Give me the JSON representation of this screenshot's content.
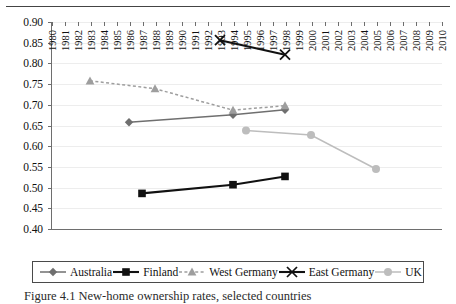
{
  "figure": {
    "caption": "Figure 4.1  New-home ownership rates, selected countries",
    "background": "#ffffff"
  },
  "chart_data": {
    "type": "line",
    "title": "",
    "xlabel": "",
    "ylabel": "",
    "xlim": [
      1980,
      2010
    ],
    "ylim": [
      0.4,
      0.9
    ],
    "grid": true,
    "legend_position": "bottom",
    "x_tick_labels": [
      "1980",
      "1981",
      "1982",
      "1983",
      "1984",
      "1985",
      "1986",
      "1987",
      "1988",
      "1989",
      "1990",
      "1991",
      "1992",
      "1993",
      "1994",
      "1995",
      "1996",
      "1997",
      "1998",
      "1999",
      "2000",
      "2001",
      "2002",
      "2003",
      "2004",
      "2005",
      "2006",
      "2007",
      "2008",
      "2009",
      "2010"
    ],
    "y_tick_labels": [
      "0.40",
      "0.45",
      "0.50",
      "0.55",
      "0.60",
      "0.65",
      "0.70",
      "0.75",
      "0.80",
      "0.85",
      "0.90"
    ],
    "y_tick_values": [
      0.4,
      0.45,
      0.5,
      0.55,
      0.6,
      0.65,
      0.7,
      0.75,
      0.8,
      0.85,
      0.9
    ],
    "series": [
      {
        "name": "Australia",
        "marker": "diamond",
        "line_style": "solid",
        "color": "#6f6f6f",
        "points": [
          {
            "x": 1986,
            "y": 0.658
          },
          {
            "x": 1994,
            "y": 0.676
          },
          {
            "x": 1998,
            "y": 0.688
          }
        ]
      },
      {
        "name": "Finland",
        "marker": "square",
        "line_style": "solid",
        "color": "#111111",
        "points": [
          {
            "x": 1987,
            "y": 0.486
          },
          {
            "x": 1994,
            "y": 0.507
          },
          {
            "x": 1998,
            "y": 0.527
          }
        ]
      },
      {
        "name": "West Germany",
        "marker": "triangle",
        "line_style": "dashed",
        "color": "#9e9e9e",
        "points": [
          {
            "x": 1983,
            "y": 0.758
          },
          {
            "x": 1988,
            "y": 0.739
          },
          {
            "x": 1994,
            "y": 0.687
          },
          {
            "x": 1998,
            "y": 0.698
          }
        ]
      },
      {
        "name": "East Germany",
        "marker": "cross",
        "line_style": "solid",
        "color": "#111111",
        "points": [
          {
            "x": 1993,
            "y": 0.856
          },
          {
            "x": 1998,
            "y": 0.821
          }
        ]
      },
      {
        "name": "UK",
        "marker": "circle",
        "line_style": "solid",
        "color": "#bdbdbd",
        "points": [
          {
            "x": 1995,
            "y": 0.638
          },
          {
            "x": 2000,
            "y": 0.627
          },
          {
            "x": 2005,
            "y": 0.545
          }
        ]
      }
    ]
  }
}
